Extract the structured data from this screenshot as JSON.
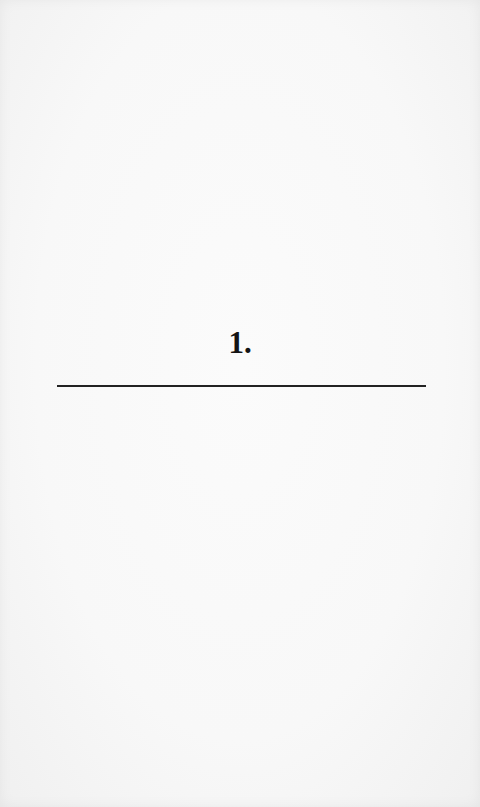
{
  "page": {
    "chapter_number": "1.",
    "background_color": "#f8f8f8",
    "text_color": "#141414",
    "rule_color": "#222222"
  }
}
